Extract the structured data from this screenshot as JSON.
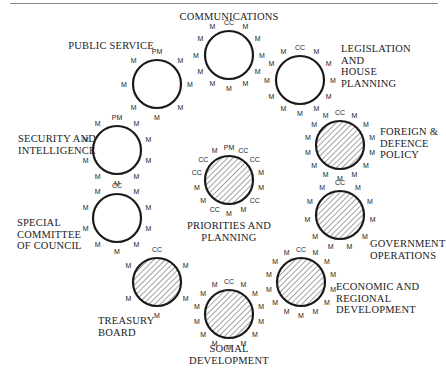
{
  "colors": {
    "ink": "#1a1a1a",
    "hatch": "#555555",
    "background": "#ffffff"
  },
  "legend_roles": {
    "PM": "Prime Minister",
    "CC": "Committee Chair",
    "M": "Minister"
  },
  "committees": [
    {
      "id": "communications",
      "name_lines": [
        "COMMUNICATIONS"
      ],
      "hatched": false,
      "roles": [
        "CC",
        "M",
        "M",
        "M",
        "M",
        "M",
        "M",
        "M",
        "M",
        "M",
        "M",
        "M"
      ]
    },
    {
      "id": "legislation-house-planning",
      "name_lines": [
        "LEGISLATION",
        "AND",
        "HOUSE",
        "PLANNING"
      ],
      "hatched": false,
      "roles": [
        "CC",
        "M",
        "M",
        "M",
        "M",
        "M",
        "M",
        "M",
        "M",
        "M",
        "M",
        "M"
      ]
    },
    {
      "id": "foreign-defence-policy",
      "name_lines": [
        "FOREIGN &",
        "DEFENCE",
        "POLICY"
      ],
      "hatched": true,
      "roles": [
        "CC",
        "M",
        "M",
        "M",
        "M",
        "M",
        "M",
        "M",
        "M",
        "M",
        "M",
        "M",
        "M",
        "M"
      ]
    },
    {
      "id": "government-operations",
      "name_lines": [
        "GOVERNMENT",
        "OPERATIONS"
      ],
      "hatched": true,
      "roles": [
        "CC",
        "M",
        "M",
        "M",
        "M",
        "M",
        "M",
        "M",
        "M",
        "M",
        "M"
      ]
    },
    {
      "id": "economic-regional-development",
      "name_lines": [
        "ECONOMIC AND",
        "REGIONAL",
        "DEVELOPMENT"
      ],
      "hatched": true,
      "roles": [
        "CC",
        "M",
        "M",
        "M",
        "M",
        "M",
        "M",
        "M",
        "M",
        "M",
        "M",
        "M",
        "M",
        "M"
      ]
    },
    {
      "id": "social-development",
      "name_lines": [
        "SOCIAL",
        "DEVELOPMENT"
      ],
      "hatched": true,
      "roles": [
        "CC",
        "M",
        "M",
        "M",
        "M",
        "M",
        "M",
        "M",
        "M",
        "M",
        "M",
        "M",
        "M",
        "M"
      ]
    },
    {
      "id": "treasury-board",
      "name_lines": [
        "TREASURY",
        "BOARD"
      ],
      "hatched": true,
      "roles": [
        "CC",
        "M",
        "M",
        "M",
        "M",
        "M"
      ]
    },
    {
      "id": "special-committee-of-council",
      "name_lines": [
        "SPECIAL",
        "COMMITTEE",
        "OF COUNCIL"
      ],
      "hatched": false,
      "roles": [
        "CC",
        "M",
        "M",
        "M",
        "M",
        "M",
        "M",
        "M",
        "M",
        "M"
      ]
    },
    {
      "id": "security-and-intelligence",
      "name_lines": [
        "SECURITY AND",
        "INTELLIGENCE"
      ],
      "hatched": false,
      "roles": [
        "PM",
        "M",
        "M",
        "M",
        "M",
        "M",
        "M",
        "M",
        "M",
        "M"
      ]
    },
    {
      "id": "public-service",
      "name_lines": [
        "PUBLIC SERVICE"
      ],
      "hatched": false,
      "roles": [
        "PM",
        "M",
        "M",
        "M",
        "M",
        "M",
        "M",
        "M"
      ]
    },
    {
      "id": "priorities-and-planning",
      "name_lines": [
        "PRIORITIES AND",
        "PLANNING"
      ],
      "hatched": true,
      "roles": [
        "PM",
        "CC",
        "CC",
        "M",
        "M",
        "CC",
        "M",
        "M",
        "CC",
        "M",
        "M",
        "CC",
        "CC",
        "M"
      ]
    }
  ]
}
